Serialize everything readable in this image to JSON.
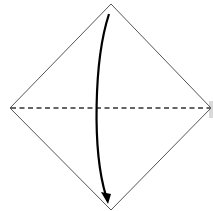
{
  "diagram": {
    "type": "origami-fold-step",
    "paper": {
      "shape": "diamond",
      "top": [
        111,
        4
      ],
      "right": [
        211,
        108
      ],
      "bottom": [
        111,
        210
      ],
      "left": [
        10,
        108
      ],
      "stroke_color": "#555555",
      "fill_color": "#ffffff"
    },
    "fold_line": {
      "style": "dashed",
      "kind": "valley-fold",
      "from": [
        10,
        108
      ],
      "to": [
        211,
        108
      ],
      "color": "#333333"
    },
    "arrow": {
      "direction": "down",
      "from": [
        109,
        14
      ],
      "to": [
        108,
        203
      ],
      "color": "#000000"
    },
    "edge_patch_color": "#d9d9d9"
  }
}
